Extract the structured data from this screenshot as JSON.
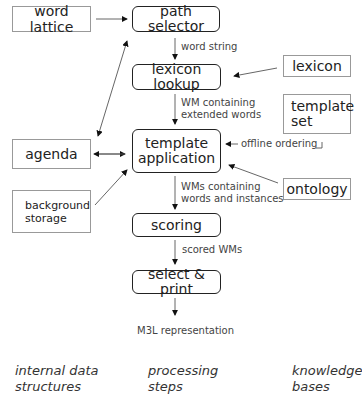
{
  "data_structures": {
    "word_lattice": "word lattice",
    "agenda": "agenda",
    "background_storage_1": "background",
    "background_storage_2": "storage"
  },
  "processing_steps": {
    "path_selector": "path selector",
    "lexicon_lookup": "lexicon lookup",
    "template_application_1": "template",
    "template_application_2": "application",
    "scoring": "scoring",
    "select_print": "select & print"
  },
  "knowledge_bases": {
    "lexicon": "lexicon",
    "template_set_1": "template",
    "template_set_2": "set",
    "ontology": "ontology"
  },
  "edge_labels": {
    "word_string": "word string",
    "wm_extended_1": "WM containing",
    "wm_extended_2": "extended words",
    "offline_ordering": "offline ordering",
    "wms_instances_1": "WMs containing",
    "wms_instances_2": "words and instances",
    "scored_wms": "scored WMs",
    "output": "M3L representation"
  },
  "legend": {
    "col1_1": "internal data",
    "col1_2": "structures",
    "col2_1": "processing",
    "col2_2": "steps",
    "col3_1": "knowledge",
    "col3_2": "bases"
  }
}
